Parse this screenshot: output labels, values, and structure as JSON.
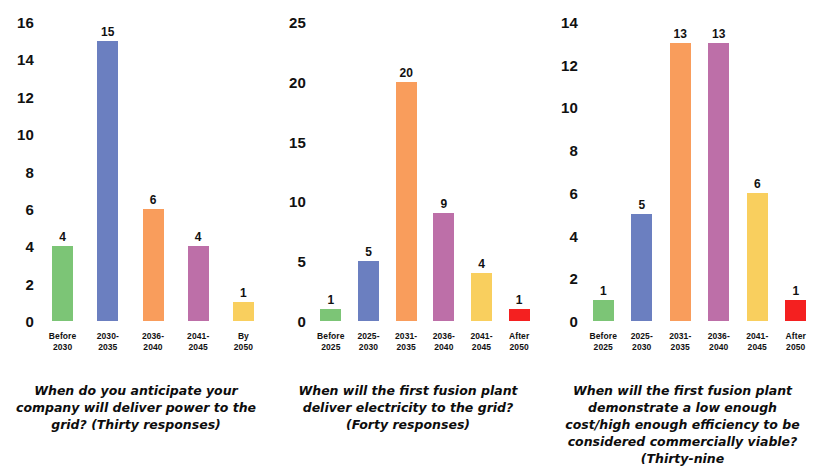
{
  "figure": {
    "panel_count": 3,
    "background": "#ffffff",
    "palette": {
      "green": "#7CC576",
      "blue": "#6B7FC0",
      "orange": "#F99D5C",
      "magenta": "#BD6FA8",
      "yellow": "#F9CF5E",
      "red": "#F42020"
    }
  },
  "chart_data": [
    {
      "type": "bar",
      "title": "",
      "caption": "When do you anticipate your company will deliver power to the grid? (Thirty responses)",
      "categories": [
        "Before\n2030",
        "2030-\n2035",
        "2036-\n2040",
        "2041-\n2045",
        "By\n2050"
      ],
      "values": [
        4,
        15,
        6,
        4,
        1
      ],
      "colors": [
        "#7CC576",
        "#6B7FC0",
        "#F99D5C",
        "#BD6FA8",
        "#F9CF5E"
      ],
      "xlabel": "",
      "ylabel": "",
      "ylim": [
        0,
        16
      ],
      "yticks": [
        0,
        2,
        4,
        6,
        8,
        10,
        12,
        14,
        16
      ],
      "grid": false,
      "legend": "none",
      "data_labels": true
    },
    {
      "type": "bar",
      "title": "",
      "caption": "When will the first fusion plant deliver electricity to the grid? (Forty responses)",
      "categories": [
        "Before\n2025",
        "2025-\n2030",
        "2031-\n2035",
        "2036-\n2040",
        "2041-\n2045",
        "After\n2050"
      ],
      "values": [
        1,
        5,
        20,
        9,
        4,
        1
      ],
      "colors": [
        "#7CC576",
        "#6B7FC0",
        "#F99D5C",
        "#BD6FA8",
        "#F9CF5E",
        "#F42020"
      ],
      "xlabel": "",
      "ylabel": "",
      "ylim": [
        0,
        25
      ],
      "yticks": [
        0,
        5,
        10,
        15,
        20,
        25
      ],
      "grid": false,
      "legend": "none",
      "data_labels": true
    },
    {
      "type": "bar",
      "title": "",
      "caption": "When will the first fusion plant demonstrate a low enough cost/high enough efficiency to be considered commercially viable? (Thirty-nine",
      "categories": [
        "Before\n2025",
        "2025-\n2030",
        "2031-\n2035",
        "2036-\n2040",
        "2041-\n2045",
        "After\n2050"
      ],
      "values": [
        1,
        5,
        13,
        13,
        6,
        1
      ],
      "colors": [
        "#7CC576",
        "#6B7FC0",
        "#F99D5C",
        "#BD6FA8",
        "#F9CF5E",
        "#F42020"
      ],
      "xlabel": "",
      "ylabel": "",
      "ylim": [
        0,
        14
      ],
      "yticks": [
        0,
        2,
        4,
        6,
        8,
        10,
        12,
        14
      ],
      "grid": false,
      "legend": "none",
      "data_labels": true
    }
  ],
  "panels": [
    {
      "caption": "When do you anticipate your company will deliver power to the grid? (Thirty responses)",
      "yticks": [
        "16",
        "14",
        "12",
        "10",
        "8",
        "6",
        "4",
        "2",
        "0"
      ],
      "bars": [
        {
          "label": "Before\n2030",
          "value": "4",
          "color": "#7CC576"
        },
        {
          "label": "2030-\n2035",
          "value": "15",
          "color": "#6B7FC0"
        },
        {
          "label": "2036-\n2040",
          "value": "6",
          "color": "#F99D5C"
        },
        {
          "label": "2041-\n2045",
          "value": "4",
          "color": "#BD6FA8"
        },
        {
          "label": "By\n2050",
          "value": "1",
          "color": "#F9CF5E"
        }
      ]
    },
    {
      "caption": "When will the first fusion plant deliver electricity to the grid? (Forty responses)",
      "yticks": [
        "25",
        "20",
        "15",
        "10",
        "5",
        "0"
      ],
      "bars": [
        {
          "label": "Before\n2025",
          "value": "1",
          "color": "#7CC576"
        },
        {
          "label": "2025-\n2030",
          "value": "5",
          "color": "#6B7FC0"
        },
        {
          "label": "2031-\n2035",
          "value": "20",
          "color": "#F99D5C"
        },
        {
          "label": "2036-\n2040",
          "value": "9",
          "color": "#BD6FA8"
        },
        {
          "label": "2041-\n2045",
          "value": "4",
          "color": "#F9CF5E"
        },
        {
          "label": "After\n2050",
          "value": "1",
          "color": "#F42020"
        }
      ]
    },
    {
      "caption": "When will the first fusion plant demonstrate a low enough cost/high enough efficiency to be considered commercially viable? (Thirty-nine",
      "yticks": [
        "14",
        "12",
        "10",
        "8",
        "6",
        "4",
        "2",
        "0"
      ],
      "bars": [
        {
          "label": "Before\n2025",
          "value": "1",
          "color": "#7CC576"
        },
        {
          "label": "2025-\n2030",
          "value": "5",
          "color": "#6B7FC0"
        },
        {
          "label": "2031-\n2035",
          "value": "13",
          "color": "#F99D5C"
        },
        {
          "label": "2036-\n2040",
          "value": "13",
          "color": "#BD6FA8"
        },
        {
          "label": "2041-\n2045",
          "value": "6",
          "color": "#F9CF5E"
        },
        {
          "label": "After\n2050",
          "value": "1",
          "color": "#F42020"
        }
      ]
    }
  ]
}
